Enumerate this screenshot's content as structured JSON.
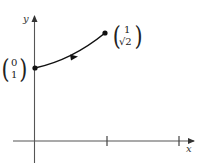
{
  "diagram": {
    "type": "parametric-curve",
    "axes": {
      "x_label": "x",
      "y_label": "y",
      "x_ticks": [
        1,
        2
      ]
    },
    "start_point": {
      "vector": [
        "0",
        "1"
      ]
    },
    "end_point": {
      "vector": [
        "1",
        "√2"
      ]
    },
    "curve": {
      "description": "curve from (0,1) to (1,√2) with direction arrow",
      "color": "#111111"
    },
    "axis_color": "#555555"
  }
}
